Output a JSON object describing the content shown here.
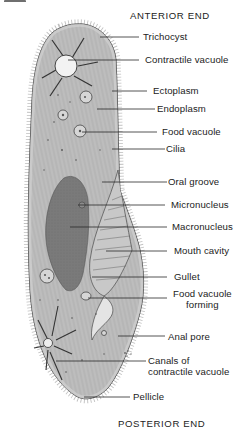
{
  "diagram": {
    "orientation_labels": {
      "top": "ANTERIOR END",
      "bottom": "POSTERIOR END"
    },
    "labels": [
      {
        "id": "trichocyst",
        "text": "Trichocyst"
      },
      {
        "id": "contractile-vacuole",
        "text": "Contractile vacuole"
      },
      {
        "id": "ectoplasm",
        "text": "Ectoplasm"
      },
      {
        "id": "endoplasm",
        "text": "Endoplasm"
      },
      {
        "id": "food-vacuole",
        "text": "Food vacuole"
      },
      {
        "id": "cilia",
        "text": "Cilia"
      },
      {
        "id": "oral-groove",
        "text": "Oral groove"
      },
      {
        "id": "micronucleus",
        "text": "Micronucleus"
      },
      {
        "id": "macronucleus",
        "text": "Macronucleus"
      },
      {
        "id": "mouth-cavity",
        "text": "Mouth cavity"
      },
      {
        "id": "gullet",
        "text": "Gullet"
      },
      {
        "id": "food-vacuole-forming",
        "text": "Food vacuole",
        "text2": "forming"
      },
      {
        "id": "anal-pore",
        "text": "Anal pore"
      },
      {
        "id": "canals",
        "text": "Canals of",
        "text2": "contractile vacuole"
      },
      {
        "id": "pellicle",
        "text": "Pellicle"
      }
    ],
    "colors": {
      "cell_fill": "#b9b9b9",
      "ectoplasm_fill": "#cfcfcf",
      "nucleus_fill": "#7d7d7d",
      "outline": "#3a3a3a",
      "leader_line": "#2a2a2a",
      "background": "#ffffff"
    }
  }
}
